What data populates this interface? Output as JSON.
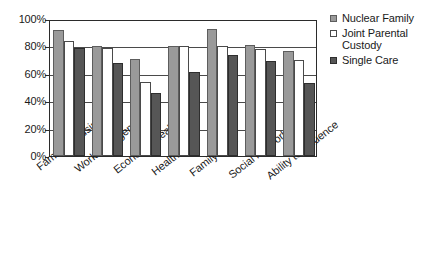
{
  "chart_data": {
    "type": "bar",
    "title": "",
    "subtitle": "",
    "xlabel": "",
    "ylabel": "",
    "ylim": [
      0,
      100
    ],
    "y_unit": "%",
    "ytick_labels": [
      "100%",
      "80%",
      "60%",
      "40%",
      "20%",
      "0%"
    ],
    "ytick_values": [
      100,
      80,
      60,
      40,
      20,
      0
    ],
    "grid": true,
    "grid_axis": "y",
    "legend_position": "right",
    "categories": [
      "Family's housing",
      "Work arrangements",
      "Economic health",
      "Health",
      "Family Type",
      "Social Network",
      "Ability to Influence"
    ],
    "series": [
      {
        "name": "Nuclear Family",
        "color": "#9a9a9a",
        "values": [
          92,
          80,
          71,
          80,
          93,
          81,
          77
        ]
      },
      {
        "name": "Joint Parental Custody",
        "color": "#ffffff",
        "values": [
          84,
          79,
          54,
          80,
          80,
          78,
          70
        ]
      },
      {
        "name": "Single Care",
        "color": "#565656",
        "values": [
          79,
          68,
          46,
          61,
          74,
          69,
          53
        ]
      }
    ]
  },
  "legend": {
    "entries": [
      {
        "label": "Nuclear Family"
      },
      {
        "label": "Joint Parental Custody"
      },
      {
        "label": "Single Care"
      }
    ]
  }
}
